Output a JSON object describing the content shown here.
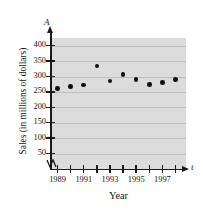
{
  "chart_data": {
    "type": "scatter",
    "title": "",
    "xlabel": "Year",
    "ylabel": "Sales (in millions of dollars)",
    "x_axis_symbol": "t",
    "y_axis_symbol": "A",
    "categories": [
      1989,
      1990,
      1991,
      1992,
      1993,
      1994,
      1995,
      1996,
      1997,
      1998
    ],
    "x": [
      1989,
      1990,
      1991,
      1992,
      1993,
      1994,
      1995,
      1996,
      1997,
      1998
    ],
    "values": [
      262,
      267,
      272,
      334,
      286,
      307,
      291,
      274,
      280,
      291
    ],
    "points": [
      {
        "x": 1989,
        "y": 262
      },
      {
        "x": 1990,
        "y": 267
      },
      {
        "x": 1991,
        "y": 272
      },
      {
        "x": 1992,
        "y": 334
      },
      {
        "x": 1993,
        "y": 286
      },
      {
        "x": 1994,
        "y": 307
      },
      {
        "x": 1995,
        "y": 291
      },
      {
        "x": 1996,
        "y": 274
      },
      {
        "x": 1997,
        "y": 280
      },
      {
        "x": 1998,
        "y": 291
      }
    ],
    "xlim": [
      1988.5,
      1998.8
    ],
    "ylim": [
      0,
      425
    ],
    "y_ticks": [
      50,
      100,
      150,
      200,
      250,
      300,
      350,
      400
    ],
    "y_tick_labels": [
      "50",
      "100",
      "150",
      "200",
      "250",
      "300",
      "350",
      "400"
    ],
    "x_ticks": [
      1989,
      1990,
      1991,
      1992,
      1993,
      1994,
      1995,
      1996,
      1997,
      1998
    ],
    "x_tick_labels": [
      "1989",
      "",
      "1991",
      "",
      "1993",
      "",
      "1995",
      "",
      "1997",
      ""
    ],
    "grid": true,
    "grid_axis": "y",
    "legend": null,
    "axis_break": true,
    "colors": {
      "plot_background": "#dcdcdc",
      "gridline": "#bdbdbd",
      "axis": "#1a1a1a",
      "marker": "#101010",
      "text": "#151515"
    }
  }
}
